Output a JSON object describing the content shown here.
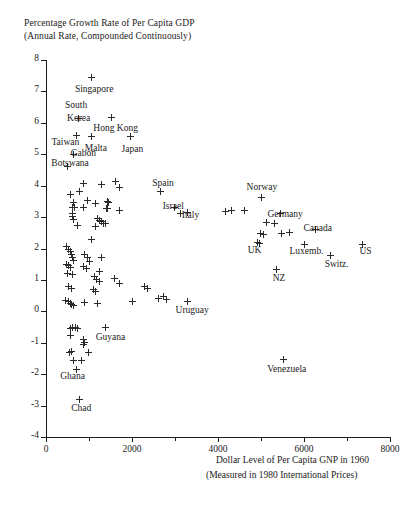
{
  "chart_data": {
    "type": "scatter",
    "title": "Percentage Growth Rate of Per Capita GDP",
    "subtitle": "(Annual Rate, Compounded Continuously)",
    "xlabel": "Dollar Level of Per Capita GNP in 1960",
    "xlabel_sub": "(Measured in 1980 International Prices)",
    "ylabel": "",
    "xlim": [
      0,
      8000
    ],
    "ylim": [
      -4,
      8
    ],
    "grid": false,
    "legend": null,
    "xticks": [
      0,
      2000,
      4000,
      6000,
      8000
    ],
    "xtick_labels": [
      "0",
      "2000",
      "4000",
      "6000",
      "8000"
    ],
    "xminor_ticks": [
      1000,
      3000,
      5000,
      7000
    ],
    "yticks": [
      -4,
      -3,
      -2,
      -1,
      0,
      1,
      2,
      3,
      4,
      5,
      6,
      7,
      8
    ],
    "ytick_labels": [
      "-4",
      "-3",
      "-2",
      "-1",
      "0",
      "1",
      "2",
      "3",
      "4",
      "5",
      "6",
      "7",
      "8"
    ],
    "marker": "plus",
    "marker_color": "#2b2b2b",
    "annotations": [
      {
        "label": "Singapore",
        "x": 1050,
        "y": 7.45,
        "lx": 1120,
        "ly": 7.05,
        "anchor": "center"
      },
      {
        "label": "South",
        "x": 760,
        "y": 6.15,
        "lx": 700,
        "ly": 6.55,
        "anchor": "center"
      },
      {
        "label": "Korea",
        "x": 760,
        "y": 6.15,
        "lx": 760,
        "ly": 6.12,
        "anchor": "center"
      },
      {
        "label": "Hong Kong",
        "x": 1520,
        "y": 6.18,
        "lx": 1620,
        "ly": 5.8,
        "anchor": "center"
      },
      {
        "label": "Taiwan",
        "x": 700,
        "y": 5.6,
        "lx": 450,
        "ly": 5.35,
        "anchor": "center"
      },
      {
        "label": "Malta",
        "x": 1060,
        "y": 5.55,
        "lx": 1160,
        "ly": 5.18,
        "anchor": "center"
      },
      {
        "label": "Japan",
        "x": 1960,
        "y": 5.55,
        "lx": 2010,
        "ly": 5.15,
        "anchor": "center"
      },
      {
        "label": "Gabon",
        "x": 640,
        "y": 5.0,
        "lx": 870,
        "ly": 5.0,
        "anchor": "center"
      },
      {
        "label": "Botswana",
        "x": 500,
        "y": 4.62,
        "lx": 560,
        "ly": 4.7,
        "anchor": "center"
      },
      {
        "label": "Spain",
        "x": 2660,
        "y": 3.82,
        "lx": 2720,
        "ly": 4.05,
        "anchor": "center"
      },
      {
        "label": "Israel",
        "x": 2980,
        "y": 3.3,
        "lx": 2960,
        "ly": 3.32,
        "anchor": "center"
      },
      {
        "label": "Italy",
        "x": 3300,
        "y": 3.15,
        "lx": 3360,
        "ly": 3.02,
        "anchor": "center"
      },
      {
        "label": "Norway",
        "x": 5020,
        "y": 3.62,
        "lx": 5020,
        "ly": 3.92,
        "anchor": "center"
      },
      {
        "label": "Germany",
        "x": 5460,
        "y": 3.12,
        "lx": 5560,
        "ly": 3.08,
        "anchor": "center"
      },
      {
        "label": "Canada",
        "x": 6260,
        "y": 2.62,
        "lx": 6320,
        "ly": 2.62,
        "anchor": "center"
      },
      {
        "label": "UK",
        "x": 4920,
        "y": 2.2,
        "lx": 4850,
        "ly": 1.92,
        "anchor": "center"
      },
      {
        "label": "Luxemb.",
        "x": 6020,
        "y": 2.12,
        "lx": 6060,
        "ly": 1.88,
        "anchor": "center"
      },
      {
        "label": "US",
        "x": 7360,
        "y": 2.12,
        "lx": 7430,
        "ly": 1.9,
        "anchor": "center"
      },
      {
        "label": "Switz.",
        "x": 6620,
        "y": 1.78,
        "lx": 6760,
        "ly": 1.48,
        "anchor": "center"
      },
      {
        "label": "NZ",
        "x": 5360,
        "y": 1.32,
        "lx": 5420,
        "ly": 1.02,
        "anchor": "center"
      },
      {
        "label": "Uruguay",
        "x": 3300,
        "y": 0.32,
        "lx": 3400,
        "ly": 0.02,
        "anchor": "center"
      },
      {
        "label": "Guyana",
        "x": 1380,
        "y": -0.52,
        "lx": 1500,
        "ly": -0.85,
        "anchor": "center"
      },
      {
        "label": "Venezuela",
        "x": 5520,
        "y": -1.52,
        "lx": 5600,
        "ly": -1.88,
        "anchor": "center"
      },
      {
        "label": "Ghana",
        "x": 700,
        "y": -1.85,
        "lx": 620,
        "ly": -2.1,
        "anchor": "center"
      },
      {
        "label": "Chad",
        "x": 780,
        "y": -2.82,
        "lx": 820,
        "ly": -3.12,
        "anchor": "center"
      }
    ],
    "points": [
      {
        "x": 1050,
        "y": 7.45
      },
      {
        "x": 760,
        "y": 6.15
      },
      {
        "x": 1520,
        "y": 6.18
      },
      {
        "x": 700,
        "y": 5.6
      },
      {
        "x": 1060,
        "y": 5.55
      },
      {
        "x": 1960,
        "y": 5.55
      },
      {
        "x": 640,
        "y": 5.0
      },
      {
        "x": 500,
        "y": 4.62
      },
      {
        "x": 880,
        "y": 4.08
      },
      {
        "x": 1300,
        "y": 4.05
      },
      {
        "x": 1620,
        "y": 4.12
      },
      {
        "x": 1700,
        "y": 3.95
      },
      {
        "x": 2660,
        "y": 3.82
      },
      {
        "x": 560,
        "y": 3.72
      },
      {
        "x": 780,
        "y": 3.8
      },
      {
        "x": 960,
        "y": 3.52
      },
      {
        "x": 640,
        "y": 3.45
      },
      {
        "x": 1160,
        "y": 3.42
      },
      {
        "x": 1420,
        "y": 3.5
      },
      {
        "x": 1460,
        "y": 3.45
      },
      {
        "x": 620,
        "y": 3.3
      },
      {
        "x": 660,
        "y": 3.3
      },
      {
        "x": 880,
        "y": 3.32
      },
      {
        "x": 1400,
        "y": 3.28
      },
      {
        "x": 1440,
        "y": 3.26
      },
      {
        "x": 620,
        "y": 3.12
      },
      {
        "x": 1720,
        "y": 3.2
      },
      {
        "x": 620,
        "y": 3.02
      },
      {
        "x": 640,
        "y": 2.92
      },
      {
        "x": 1200,
        "y": 2.95
      },
      {
        "x": 1240,
        "y": 2.88
      },
      {
        "x": 1280,
        "y": 2.85
      },
      {
        "x": 1340,
        "y": 2.8
      },
      {
        "x": 1380,
        "y": 2.78
      },
      {
        "x": 740,
        "y": 2.72
      },
      {
        "x": 1160,
        "y": 2.7
      },
      {
        "x": 2980,
        "y": 3.3
      },
      {
        "x": 3300,
        "y": 3.15
      },
      {
        "x": 3120,
        "y": 3.12
      },
      {
        "x": 4180,
        "y": 3.18
      },
      {
        "x": 4320,
        "y": 3.22
      },
      {
        "x": 4620,
        "y": 3.2
      },
      {
        "x": 5020,
        "y": 3.62
      },
      {
        "x": 5460,
        "y": 3.12
      },
      {
        "x": 5120,
        "y": 2.82
      },
      {
        "x": 5320,
        "y": 2.78
      },
      {
        "x": 6260,
        "y": 2.62
      },
      {
        "x": 4980,
        "y": 2.48
      },
      {
        "x": 5060,
        "y": 2.45
      },
      {
        "x": 5480,
        "y": 2.48
      },
      {
        "x": 5660,
        "y": 2.52
      },
      {
        "x": 7360,
        "y": 2.12
      },
      {
        "x": 4920,
        "y": 2.2
      },
      {
        "x": 4960,
        "y": 2.15
      },
      {
        "x": 6020,
        "y": 2.12
      },
      {
        "x": 6620,
        "y": 1.78
      },
      {
        "x": 5360,
        "y": 1.32
      },
      {
        "x": 1060,
        "y": 2.3
      },
      {
        "x": 480,
        "y": 2.05
      },
      {
        "x": 520,
        "y": 1.98
      },
      {
        "x": 560,
        "y": 1.9
      },
      {
        "x": 600,
        "y": 1.82
      },
      {
        "x": 620,
        "y": 1.72
      },
      {
        "x": 640,
        "y": 1.62
      },
      {
        "x": 900,
        "y": 1.8
      },
      {
        "x": 960,
        "y": 1.7
      },
      {
        "x": 1020,
        "y": 1.6
      },
      {
        "x": 1300,
        "y": 1.72
      },
      {
        "x": 480,
        "y": 1.5
      },
      {
        "x": 520,
        "y": 1.45
      },
      {
        "x": 560,
        "y": 1.38
      },
      {
        "x": 880,
        "y": 1.42
      },
      {
        "x": 940,
        "y": 1.35
      },
      {
        "x": 1240,
        "y": 1.28
      },
      {
        "x": 500,
        "y": 1.22
      },
      {
        "x": 620,
        "y": 1.18
      },
      {
        "x": 1120,
        "y": 1.1
      },
      {
        "x": 1180,
        "y": 1.02
      },
      {
        "x": 1240,
        "y": 0.95
      },
      {
        "x": 1600,
        "y": 1.05
      },
      {
        "x": 1700,
        "y": 0.88
      },
      {
        "x": 520,
        "y": 0.8
      },
      {
        "x": 600,
        "y": 0.72
      },
      {
        "x": 1100,
        "y": 0.7
      },
      {
        "x": 1140,
        "y": 0.62
      },
      {
        "x": 2300,
        "y": 0.78
      },
      {
        "x": 2360,
        "y": 0.72
      },
      {
        "x": 460,
        "y": 0.35
      },
      {
        "x": 520,
        "y": 0.3
      },
      {
        "x": 560,
        "y": 0.25
      },
      {
        "x": 600,
        "y": 0.22
      },
      {
        "x": 640,
        "y": 0.18
      },
      {
        "x": 900,
        "y": 0.28
      },
      {
        "x": 1200,
        "y": 0.25
      },
      {
        "x": 2000,
        "y": 0.32
      },
      {
        "x": 2620,
        "y": 0.42
      },
      {
        "x": 2740,
        "y": 0.48
      },
      {
        "x": 2800,
        "y": 0.38
      },
      {
        "x": 3300,
        "y": 0.32
      },
      {
        "x": 560,
        "y": -0.55
      },
      {
        "x": 620,
        "y": -0.52
      },
      {
        "x": 680,
        "y": -0.5
      },
      {
        "x": 740,
        "y": -0.55
      },
      {
        "x": 1380,
        "y": -0.52
      },
      {
        "x": 560,
        "y": -0.78
      },
      {
        "x": 880,
        "y": -0.9
      },
      {
        "x": 900,
        "y": -0.98
      },
      {
        "x": 880,
        "y": -1.05
      },
      {
        "x": 540,
        "y": -1.32
      },
      {
        "x": 600,
        "y": -1.28
      },
      {
        "x": 980,
        "y": -1.3
      },
      {
        "x": 640,
        "y": -1.55
      },
      {
        "x": 820,
        "y": -1.58
      },
      {
        "x": 700,
        "y": -1.85
      },
      {
        "x": 5520,
        "y": -1.52
      },
      {
        "x": 780,
        "y": -2.82
      }
    ]
  }
}
